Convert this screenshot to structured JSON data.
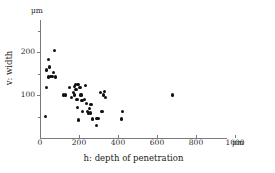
{
  "chart_data": {
    "type": "scatter",
    "title": "",
    "xlabel": "h: depth of penetration",
    "ylabel": "v: width",
    "x_unit": "µm",
    "y_unit": "µm",
    "xlim": [
      0,
      1060
    ],
    "ylim": [
      0,
      275
    ],
    "grid": false,
    "legend": null,
    "x_ticks": [
      0,
      200,
      400,
      600,
      800,
      1000
    ],
    "x_tick_labels": [
      "0",
      "200",
      "400",
      "600",
      "800",
      "1000"
    ],
    "y_ticks": [
      100,
      200
    ],
    "y_tick_labels": [
      "100",
      "200"
    ],
    "y_minor_ticks": [
      50,
      150,
      250
    ],
    "marker": "filled-circle",
    "marker_color": "#111111",
    "axis_color": "#7a7a7a",
    "n_points": 48,
    "points": [
      {
        "x": 30,
        "y": 50
      },
      {
        "x": 32,
        "y": 118
      },
      {
        "x": 35,
        "y": 158
      },
      {
        "x": 42,
        "y": 182
      },
      {
        "x": 45,
        "y": 142
      },
      {
        "x": 50,
        "y": 165
      },
      {
        "x": 55,
        "y": 143
      },
      {
        "x": 62,
        "y": 143
      },
      {
        "x": 70,
        "y": 152
      },
      {
        "x": 75,
        "y": 203
      },
      {
        "x": 78,
        "y": 142
      },
      {
        "x": 120,
        "y": 100
      },
      {
        "x": 130,
        "y": 100
      },
      {
        "x": 150,
        "y": 118
      },
      {
        "x": 160,
        "y": 95
      },
      {
        "x": 170,
        "y": 106
      },
      {
        "x": 175,
        "y": 120
      },
      {
        "x": 178,
        "y": 100
      },
      {
        "x": 182,
        "y": 125
      },
      {
        "x": 185,
        "y": 113
      },
      {
        "x": 190,
        "y": 90
      },
      {
        "x": 192,
        "y": 70
      },
      {
        "x": 195,
        "y": 125
      },
      {
        "x": 198,
        "y": 42
      },
      {
        "x": 205,
        "y": 118
      },
      {
        "x": 210,
        "y": 100
      },
      {
        "x": 215,
        "y": 88
      },
      {
        "x": 220,
        "y": 62
      },
      {
        "x": 230,
        "y": 90
      },
      {
        "x": 235,
        "y": 122
      },
      {
        "x": 240,
        "y": 80
      },
      {
        "x": 245,
        "y": 62
      },
      {
        "x": 248,
        "y": 58
      },
      {
        "x": 252,
        "y": 68
      },
      {
        "x": 258,
        "y": 58
      },
      {
        "x": 262,
        "y": 78
      },
      {
        "x": 268,
        "y": 44
      },
      {
        "x": 288,
        "y": 30
      },
      {
        "x": 292,
        "y": 45
      },
      {
        "x": 300,
        "y": 45
      },
      {
        "x": 310,
        "y": 105
      },
      {
        "x": 318,
        "y": 62
      },
      {
        "x": 325,
        "y": 100
      },
      {
        "x": 332,
        "y": 108
      },
      {
        "x": 336,
        "y": 95
      },
      {
        "x": 420,
        "y": 44
      },
      {
        "x": 425,
        "y": 62
      },
      {
        "x": 680,
        "y": 100
      }
    ]
  },
  "axes": {
    "x_title": "h: depth of penetration",
    "y_title": "v: width",
    "x_unit_label": "µm",
    "y_unit_label": "µm"
  }
}
